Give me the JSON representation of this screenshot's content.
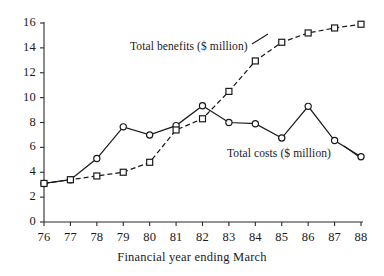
{
  "chart_data": {
    "type": "line",
    "title": "",
    "xlabel": "Financial year ending March",
    "ylabel": "",
    "x": [
      76,
      77,
      78,
      79,
      80,
      81,
      82,
      83,
      84,
      85,
      86,
      87,
      88
    ],
    "xtick_labels": [
      "76",
      "77",
      "78",
      "79",
      "80",
      "81",
      "82",
      "83",
      "84",
      "85",
      "86",
      "87",
      "88"
    ],
    "ytick_labels": [
      "0",
      "2",
      "4",
      "6",
      "8",
      "10",
      "12",
      "14",
      "16"
    ],
    "yticks": [
      0,
      2,
      4,
      6,
      8,
      10,
      12,
      14,
      16
    ],
    "xlim": [
      76,
      88
    ],
    "ylim": [
      0,
      16
    ],
    "grid": false,
    "legend_position": "inline-annotation",
    "series": [
      {
        "name": "Total costs ($ million)",
        "marker": "circle",
        "linestyle": "solid",
        "color": "#1a1a1a",
        "values": [
          3.1,
          3.4,
          5.1,
          7.65,
          7.0,
          7.75,
          9.35,
          8.0,
          7.9,
          6.75,
          9.3,
          6.55,
          5.25
        ]
      },
      {
        "name": "Total benefits ($ million)",
        "marker": "square",
        "linestyle": "dashed",
        "color": "#1a1a1a",
        "values": [
          3.1,
          3.4,
          3.7,
          4.0,
          4.8,
          7.4,
          8.3,
          10.5,
          12.95,
          14.45,
          15.2,
          15.6,
          15.9
        ]
      }
    ],
    "annotations": [
      {
        "text": "Total benefits ($ million)",
        "x": 130,
        "y": 40
      },
      {
        "text": "Total costs ($ million)",
        "x": 227,
        "y": 147
      }
    ]
  }
}
